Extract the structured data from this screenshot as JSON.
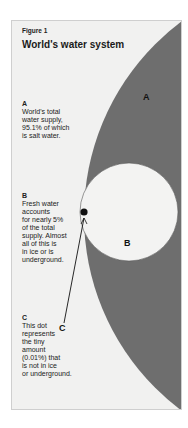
{
  "figure": {
    "label": "Figure 1",
    "title": "World's water system"
  },
  "notes": {
    "a": {
      "key": "A",
      "lines": [
        "World's total",
        "water supply,",
        "95.1% of which",
        "is salt water."
      ]
    },
    "b": {
      "key": "B",
      "lines": [
        "Fresh water",
        "accounts",
        "for nearly 5%",
        "of the total",
        "supply.  Almost",
        "all of this is",
        "in ice or is",
        "underground."
      ]
    },
    "c": {
      "key": "C",
      "lines": [
        "This dot",
        "represents",
        "the tiny",
        "amount",
        "(0.01%) that",
        "is not in ice",
        "or underground."
      ]
    }
  },
  "diagram_labels": {
    "a": "A",
    "b": "B",
    "c": "C"
  },
  "colors": {
    "total_water_fill": "#6e6e6e",
    "fresh_water_fill": "#f3f3f2",
    "frame_background": "#f1f1f0",
    "dot": "#111111"
  }
}
